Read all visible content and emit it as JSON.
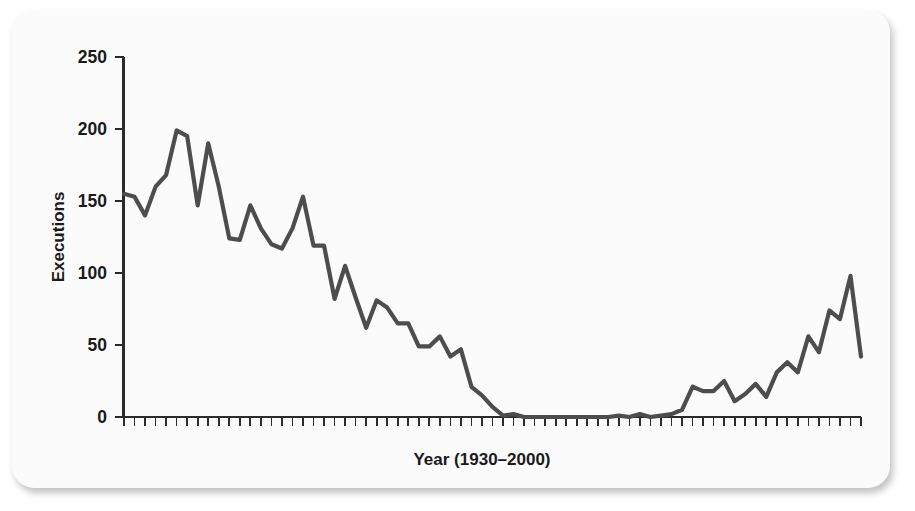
{
  "figure": {
    "background_color": "#fbfbfb",
    "line_color": "#4d4d4d",
    "axis_color": "#2b2b2b"
  },
  "chart_data": {
    "type": "line",
    "title": "",
    "xlabel": "Year (1930–2000)",
    "ylabel": "Executions",
    "ylim": [
      0,
      250
    ],
    "yticks": [
      0,
      50,
      100,
      150,
      200,
      250
    ],
    "ytick_labels": [
      "0",
      "50",
      "100",
      "150",
      "200",
      "250"
    ],
    "xlim": [
      1930,
      2000
    ],
    "xticks_every": 1,
    "xtick_labels": [],
    "grid": false,
    "legend": null,
    "x": [
      1930,
      1931,
      1932,
      1933,
      1934,
      1935,
      1936,
      1937,
      1938,
      1939,
      1940,
      1941,
      1942,
      1943,
      1944,
      1945,
      1946,
      1947,
      1948,
      1949,
      1950,
      1951,
      1952,
      1953,
      1954,
      1955,
      1956,
      1957,
      1958,
      1959,
      1960,
      1961,
      1962,
      1963,
      1964,
      1965,
      1966,
      1967,
      1968,
      1969,
      1970,
      1971,
      1972,
      1973,
      1974,
      1975,
      1976,
      1977,
      1978,
      1979,
      1980,
      1981,
      1982,
      1983,
      1984,
      1985,
      1986,
      1987,
      1988,
      1989,
      1990,
      1991,
      1992,
      1993,
      1994,
      1995,
      1996,
      1997,
      1998,
      1999,
      2000
    ],
    "values": [
      155,
      153,
      140,
      160,
      168,
      199,
      195,
      147,
      190,
      160,
      124,
      123,
      147,
      131,
      120,
      117,
      131,
      153,
      119,
      119,
      82,
      105,
      83,
      62,
      81,
      76,
      65,
      65,
      49,
      49,
      56,
      42,
      47,
      21,
      15,
      7,
      1,
      2,
      0,
      0,
      0,
      0,
      0,
      0,
      0,
      0,
      0,
      1,
      0,
      2,
      0,
      1,
      2,
      5,
      21,
      18,
      18,
      25,
      11,
      16,
      23,
      14,
      31,
      38,
      31,
      56,
      45,
      74,
      68,
      98,
      42
    ],
    "series_name": "Executions"
  }
}
